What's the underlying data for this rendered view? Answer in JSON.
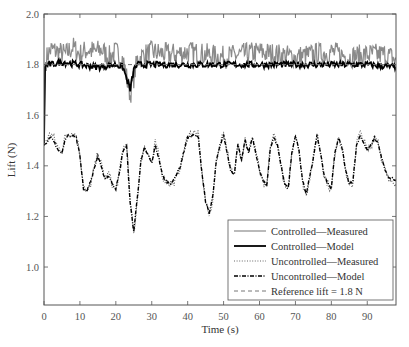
{
  "chart_data": {
    "type": "line",
    "title": "",
    "xlabel": "Time (s)",
    "ylabel": "Lift (N)",
    "xlim": [
      0,
      98
    ],
    "ylim": [
      0.85,
      2.0
    ],
    "xticks": [
      0,
      10,
      20,
      30,
      40,
      50,
      60,
      70,
      80,
      90
    ],
    "yticks": [
      1.0,
      1.2,
      1.4,
      1.6,
      1.8,
      2.0
    ],
    "ytick_labels": [
      "1.0",
      "1.2",
      "1.4",
      "1.6",
      "1.8",
      "2.0"
    ],
    "grid": false,
    "legend_position": "lower right",
    "reference_value": 1.8,
    "series": [
      {
        "name": "Controlled—Measured",
        "style": "solid-gray",
        "color": "#8a8a8a",
        "description": "noisy signal around 1.82 N, range ~1.75-1.90 N after initial rise at t=0; dip to ~1.68 at t~24",
        "x": [
          0,
          0.3,
          1,
          2,
          4,
          6,
          8,
          10,
          12,
          14,
          16,
          18,
          20,
          22,
          24,
          26,
          28,
          30,
          35,
          40,
          45,
          50,
          55,
          60,
          65,
          70,
          75,
          80,
          85,
          90,
          95,
          98
        ],
        "values": [
          1.49,
          1.8,
          1.84,
          1.86,
          1.85,
          1.84,
          1.87,
          1.84,
          1.86,
          1.85,
          1.86,
          1.83,
          1.85,
          1.82,
          1.68,
          1.82,
          1.84,
          1.85,
          1.84,
          1.85,
          1.84,
          1.83,
          1.84,
          1.85,
          1.84,
          1.83,
          1.84,
          1.85,
          1.83,
          1.84,
          1.84,
          1.82
        ]
      },
      {
        "name": "Controlled—Model",
        "style": "solid-black-thick",
        "color": "#000000",
        "x": [
          0,
          0.3,
          1,
          2,
          5,
          10,
          15,
          20,
          22,
          24,
          25,
          26,
          30,
          40,
          50,
          60,
          70,
          80,
          90,
          98
        ],
        "values": [
          1.49,
          1.79,
          1.8,
          1.8,
          1.81,
          1.8,
          1.79,
          1.8,
          1.79,
          1.7,
          1.78,
          1.8,
          1.8,
          1.8,
          1.8,
          1.8,
          1.8,
          1.8,
          1.8,
          1.79
        ]
      },
      {
        "name": "Uncontrolled—Measured",
        "style": "dotted",
        "color": "#555555",
        "x": [
          0,
          1,
          2,
          3,
          4,
          5,
          6,
          7,
          8,
          9,
          10,
          11,
          12,
          13,
          14,
          15,
          16,
          17,
          18,
          19,
          20,
          21,
          22,
          23,
          24,
          25,
          26,
          27,
          28,
          29,
          30,
          31,
          32,
          33,
          34,
          35,
          36,
          37,
          38,
          39,
          40,
          41,
          42,
          43,
          44,
          45,
          46,
          47,
          48,
          49,
          50,
          51,
          52,
          53,
          54,
          55,
          56,
          57,
          58,
          59,
          60,
          61,
          62,
          63,
          64,
          65,
          66,
          67,
          68,
          69,
          70,
          71,
          72,
          73,
          74,
          75,
          76,
          77,
          78,
          79,
          80,
          81,
          82,
          83,
          84,
          85,
          86,
          87,
          88,
          89,
          90,
          91,
          92,
          93,
          94,
          95,
          96,
          97,
          98
        ],
        "values": [
          1.49,
          1.51,
          1.53,
          1.5,
          1.47,
          1.46,
          1.52,
          1.53,
          1.53,
          1.52,
          1.45,
          1.32,
          1.29,
          1.33,
          1.39,
          1.45,
          1.4,
          1.35,
          1.37,
          1.33,
          1.3,
          1.37,
          1.47,
          1.49,
          1.26,
          1.13,
          1.27,
          1.42,
          1.48,
          1.45,
          1.41,
          1.49,
          1.44,
          1.36,
          1.34,
          1.33,
          1.33,
          1.36,
          1.4,
          1.46,
          1.52,
          1.53,
          1.53,
          1.52,
          1.37,
          1.26,
          1.2,
          1.27,
          1.42,
          1.48,
          1.54,
          1.46,
          1.38,
          1.36,
          1.5,
          1.42,
          1.51,
          1.45,
          1.52,
          1.46,
          1.38,
          1.33,
          1.31,
          1.48,
          1.52,
          1.49,
          1.4,
          1.32,
          1.3,
          1.45,
          1.53,
          1.47,
          1.33,
          1.28,
          1.36,
          1.43,
          1.53,
          1.46,
          1.36,
          1.33,
          1.3,
          1.45,
          1.52,
          1.47,
          1.38,
          1.32,
          1.33,
          1.49,
          1.53,
          1.5,
          1.46,
          1.48,
          1.52,
          1.5,
          1.43,
          1.38,
          1.34,
          1.35,
          1.33
        ]
      },
      {
        "name": "Uncontrolled—Model",
        "style": "dash-dot",
        "color": "#000000",
        "x": [
          0,
          1,
          2,
          3,
          4,
          5,
          6,
          7,
          8,
          9,
          10,
          11,
          12,
          13,
          14,
          15,
          16,
          17,
          18,
          19,
          20,
          21,
          22,
          23,
          24,
          25,
          26,
          27,
          28,
          29,
          30,
          31,
          32,
          33,
          34,
          35,
          36,
          37,
          38,
          39,
          40,
          41,
          42,
          43,
          44,
          45,
          46,
          47,
          48,
          49,
          50,
          51,
          52,
          53,
          54,
          55,
          56,
          57,
          58,
          59,
          60,
          61,
          62,
          63,
          64,
          65,
          66,
          67,
          68,
          69,
          70,
          71,
          72,
          73,
          74,
          75,
          76,
          77,
          78,
          79,
          80,
          81,
          82,
          83,
          84,
          85,
          86,
          87,
          88,
          89,
          90,
          91,
          92,
          93,
          94,
          95,
          96,
          97,
          98
        ],
        "values": [
          1.48,
          1.5,
          1.51,
          1.49,
          1.46,
          1.45,
          1.51,
          1.52,
          1.52,
          1.51,
          1.44,
          1.31,
          1.3,
          1.34,
          1.39,
          1.44,
          1.39,
          1.35,
          1.36,
          1.33,
          1.31,
          1.37,
          1.46,
          1.48,
          1.25,
          1.14,
          1.28,
          1.42,
          1.47,
          1.44,
          1.41,
          1.48,
          1.43,
          1.36,
          1.34,
          1.33,
          1.34,
          1.37,
          1.4,
          1.46,
          1.51,
          1.52,
          1.52,
          1.51,
          1.37,
          1.26,
          1.21,
          1.28,
          1.42,
          1.48,
          1.52,
          1.45,
          1.38,
          1.37,
          1.49,
          1.42,
          1.5,
          1.45,
          1.51,
          1.45,
          1.38,
          1.34,
          1.32,
          1.47,
          1.51,
          1.48,
          1.4,
          1.33,
          1.31,
          1.45,
          1.52,
          1.46,
          1.34,
          1.29,
          1.36,
          1.43,
          1.52,
          1.45,
          1.36,
          1.33,
          1.31,
          1.45,
          1.51,
          1.47,
          1.38,
          1.33,
          1.34,
          1.48,
          1.52,
          1.49,
          1.46,
          1.48,
          1.51,
          1.49,
          1.43,
          1.38,
          1.35,
          1.35,
          1.34
        ]
      },
      {
        "name": "Reference lift = 1.8 N",
        "style": "dashed",
        "color": "#666666",
        "x": [
          0,
          98
        ],
        "values": [
          1.8,
          1.8
        ]
      }
    ]
  },
  "legend": {
    "items": [
      {
        "label": "Controlled—Measured",
        "style": "solid-gray"
      },
      {
        "label": "Controlled—Model",
        "style": "solid-black-thick"
      },
      {
        "label": "Uncontrolled—Measured",
        "style": "dotted"
      },
      {
        "label": "Uncontrolled—Model",
        "style": "dash-dot"
      },
      {
        "label": "Reference lift = 1.8 N",
        "style": "dashed"
      }
    ]
  },
  "axes": {
    "xlabel": "Time (s)",
    "ylabel": "Lift (N)"
  }
}
